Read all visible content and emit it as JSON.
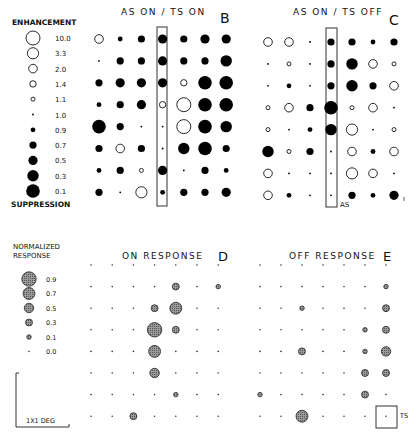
{
  "legend_top": {
    "title_top": "ENHANCEMENT",
    "title_bottom": "SUPPRESSION",
    "items": [
      {
        "label": "10.0",
        "value": 10.0
      },
      {
        "label": "3.3",
        "value": 3.3
      },
      {
        "label": "2.0",
        "value": 2.0
      },
      {
        "label": "1.4",
        "value": 1.4
      },
      {
        "label": "1.1",
        "value": 1.1
      },
      {
        "label": "1.0",
        "value": 1.0
      },
      {
        "label": "0.9",
        "value": 0.9
      },
      {
        "label": "0.7",
        "value": 0.7
      },
      {
        "label": "0.5",
        "value": 0.5
      },
      {
        "label": "0.3",
        "value": 0.3
      },
      {
        "label": "0.1",
        "value": 0.1
      }
    ]
  },
  "legend_bottom": {
    "title_line1": "NORMALIZED",
    "title_line2": "RESPONSE",
    "items": [
      {
        "label": "0.9",
        "value": 0.9
      },
      {
        "label": "0.7",
        "value": 0.7
      },
      {
        "label": "0.5",
        "value": 0.5
      },
      {
        "label": "0.3",
        "value": 0.3
      },
      {
        "label": "0.1",
        "value": 0.1
      },
      {
        "label": "0.0",
        "value": 0.0
      }
    ],
    "scale_bar_label": "1X1 DEG"
  },
  "panels": {
    "B": {
      "letter": "B",
      "title": "AS ON / TS ON"
    },
    "C": {
      "letter": "C",
      "title": "AS ON / TS OFF",
      "as_label": "AS"
    },
    "D": {
      "letter": "D",
      "title": "ON RESPONSE"
    },
    "E": {
      "letter": "E",
      "title": "OFF RESPONSE",
      "ts_label": "TS"
    }
  },
  "chart_data": [
    {
      "type": "heatmap",
      "title": "AS ON / TS ON",
      "panel": "B",
      "encoding": "circle size: open = enhancement (>1), filled = suppression (<1)",
      "rows": 8,
      "cols": 7,
      "highlight_column": 4,
      "values": [
        [
          2.0,
          0.9,
          0.7,
          0.5,
          0.7,
          0.5,
          0.5
        ],
        [
          1.0,
          0.7,
          0.7,
          0.5,
          0.7,
          0.7,
          0.3
        ],
        [
          0.7,
          0.5,
          0.5,
          0.5,
          1.4,
          0.1,
          0.1
        ],
        [
          0.9,
          0.7,
          0.5,
          1.4,
          10.0,
          0.1,
          0.1
        ],
        [
          0.1,
          0.7,
          1.0,
          1.0,
          10.0,
          0.1,
          0.3
        ],
        [
          0.7,
          2.0,
          0.7,
          1.0,
          0.3,
          0.1,
          0.7
        ],
        [
          0.9,
          0.7,
          1.1,
          0.5,
          1.0,
          0.7,
          0.9
        ],
        [
          0.7,
          1.0,
          3.3,
          0.9,
          0.7,
          0.7,
          0.5
        ]
      ]
    },
    {
      "type": "heatmap",
      "title": "AS ON / TS OFF",
      "panel": "C",
      "encoding": "circle size: open = enhancement (>1), filled = suppression (<1)",
      "rows": 8,
      "cols": 7,
      "highlight_column": 4,
      "values": [
        [
          2.0,
          2.0,
          1.0,
          0.7,
          0.7,
          0.9,
          0.7
        ],
        [
          1.0,
          1.1,
          1.0,
          0.7,
          0.3,
          2.0,
          1.1
        ],
        [
          1.0,
          0.9,
          1.0,
          0.7,
          0.3,
          0.7,
          2.0
        ],
        [
          1.1,
          2.0,
          0.7,
          0.1,
          1.1,
          2.0,
          1.0
        ],
        [
          1.1,
          1.0,
          0.9,
          0.3,
          3.3,
          1.0,
          1.1
        ],
        [
          0.3,
          1.1,
          0.7,
          1.0,
          2.0,
          0.9,
          2.0
        ],
        [
          2.0,
          1.0,
          1.0,
          1.0,
          3.3,
          2.0,
          1.0
        ],
        [
          2.0,
          0.9,
          1.0,
          1.0,
          0.7,
          0.9,
          0.5
        ]
      ]
    },
    {
      "type": "heatmap",
      "title": "ON RESPONSE",
      "panel": "D",
      "encoding": "shaded circle size = normalized response (0.0–0.9)",
      "rows": 8,
      "cols": 7,
      "values": [
        [
          0,
          0,
          0,
          0,
          0,
          0,
          0
        ],
        [
          0,
          0,
          0,
          0,
          0.3,
          0,
          0.1
        ],
        [
          0,
          0,
          0,
          0.3,
          0.7,
          0,
          0
        ],
        [
          0,
          0,
          0,
          0.9,
          0.3,
          0,
          0
        ],
        [
          0,
          0,
          0,
          0.7,
          0,
          0,
          0
        ],
        [
          0,
          0,
          0,
          0.5,
          0,
          0,
          0
        ],
        [
          0,
          0,
          0,
          0,
          0.1,
          0,
          0
        ],
        [
          0,
          0,
          0.3,
          0,
          0,
          0,
          0
        ]
      ]
    },
    {
      "type": "heatmap",
      "title": "OFF RESPONSE",
      "panel": "E",
      "encoding": "shaded circle size = normalized response (0.0–0.9)",
      "rows": 8,
      "cols": 7,
      "ts_box": {
        "row": 7,
        "col": 6
      },
      "values": [
        [
          0,
          0,
          0,
          0,
          0,
          0,
          0
        ],
        [
          0,
          0,
          0,
          0,
          0,
          0,
          0.1
        ],
        [
          0,
          0,
          0.1,
          0,
          0,
          0,
          0.3
        ],
        [
          0,
          0,
          0,
          0,
          0,
          0.1,
          0.3
        ],
        [
          0,
          0,
          0.3,
          0,
          0,
          0.1,
          0.5
        ],
        [
          0,
          0,
          0,
          0,
          0,
          0.3,
          0.3
        ],
        [
          0.1,
          0,
          0,
          0,
          0,
          0.3,
          0
        ],
        [
          0,
          0,
          0.7,
          0,
          0,
          0,
          0
        ]
      ]
    }
  ]
}
